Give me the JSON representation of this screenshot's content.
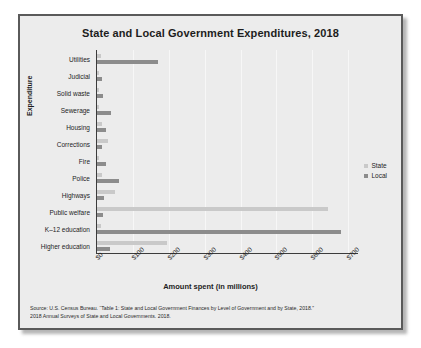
{
  "chart_data": {
    "type": "bar",
    "orientation": "horizontal",
    "title": "State and Local Government Expenditures, 2018",
    "xlabel": "Amount spent (in millions)",
    "ylabel": "Expenditure",
    "xlim": [
      0,
      730
    ],
    "xticks": [
      "$0",
      "$100",
      "$200",
      "$300",
      "$400",
      "$500",
      "$600",
      "$700"
    ],
    "xtick_values": [
      0,
      100,
      200,
      300,
      400,
      500,
      600,
      700
    ],
    "grid": "vertical",
    "legend_position": "right",
    "categories": [
      "Utilities",
      "Judicial",
      "Solid waste",
      "Sewerage",
      "Housing",
      "Corrections",
      "Fire",
      "Police",
      "Highways",
      "Public welfare",
      "K–12 education",
      "Higher education"
    ],
    "series": [
      {
        "name": "State",
        "color": "#c9c9c9",
        "values": [
          10,
          2,
          1,
          2,
          14,
          32,
          1,
          15,
          50,
          645,
          12,
          195
        ]
      },
      {
        "name": "Local",
        "color": "#8c8c8c",
        "values": [
          170,
          14,
          16,
          40,
          25,
          13,
          25,
          62,
          20,
          18,
          680,
          35
        ]
      }
    ]
  },
  "legend": {
    "items": [
      {
        "label": "State",
        "color": "#c9c9c9"
      },
      {
        "label": "Local",
        "color": "#8c8c8c"
      }
    ]
  },
  "source": {
    "line1": "Source: U.S. Census Bureau. “Table 1: State and Local Government Finances by Level of Government and by State, 2018.”",
    "line2": "2018 Annual Surveys of State and Local Governments. 2018."
  }
}
